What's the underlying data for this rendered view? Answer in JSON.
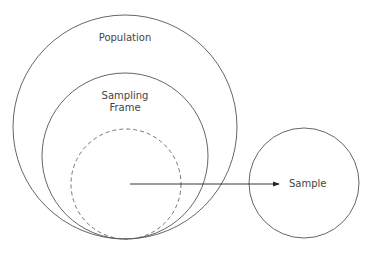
{
  "diagram": {
    "labels": {
      "population": "Population",
      "sampling_frame_line1": "Sampling",
      "sampling_frame_line2": "Frame",
      "sample": "Sample"
    },
    "nodes": [
      {
        "id": "population",
        "label": "Population",
        "shape": "circle",
        "style": "solid"
      },
      {
        "id": "sampling_frame",
        "label": "Sampling Frame",
        "shape": "circle",
        "style": "solid",
        "inside": "population"
      },
      {
        "id": "selected_subset",
        "label": "",
        "shape": "circle",
        "style": "dashed",
        "inside": "sampling_frame"
      },
      {
        "id": "sample",
        "label": "Sample",
        "shape": "circle",
        "style": "solid"
      }
    ],
    "edges": [
      {
        "from": "selected_subset",
        "to": "sample",
        "type": "arrow"
      }
    ],
    "colors": {
      "stroke": "#555555",
      "text": "#444444",
      "background": "#ffffff"
    }
  }
}
